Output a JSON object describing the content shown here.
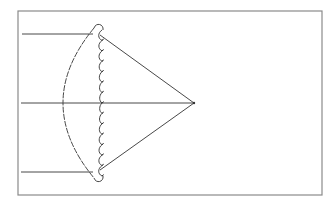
{
  "diagram": {
    "type": "optics-ray-diagram",
    "colors": {
      "background": "#ffffff",
      "frame": "#8a8a8a",
      "ink": "#333333"
    },
    "frame": {
      "x": 18,
      "y": 11,
      "width": 304,
      "height": 184
    },
    "incoming_rays": [
      {
        "name": "top-ray",
        "x1": 22,
        "y1": 34,
        "x2": 93,
        "y2": 34
      },
      {
        "name": "axis-ray",
        "x1": 21,
        "y1": 103,
        "x2": 194,
        "y2": 103
      },
      {
        "name": "bottom-ray",
        "x1": 21,
        "y1": 172,
        "x2": 93,
        "y2": 172
      }
    ],
    "refracted_rays": [
      {
        "name": "top-converging-ray",
        "x1": 100,
        "y1": 35,
        "x2": 194,
        "y2": 103
      },
      {
        "name": "bottom-converging-ray",
        "x1": 100,
        "y1": 170,
        "x2": 194,
        "y2": 103
      }
    ],
    "focal_point": {
      "x": 194,
      "y": 103
    },
    "lens": {
      "refractive_surface": {
        "top": [
          94,
          28
        ],
        "apex": [
          63,
          103
        ],
        "bottom": [
          94,
          178
        ]
      },
      "diffractive_surface": {
        "x": 102,
        "top": 30,
        "bottom": 176,
        "zones": 14
      }
    }
  }
}
